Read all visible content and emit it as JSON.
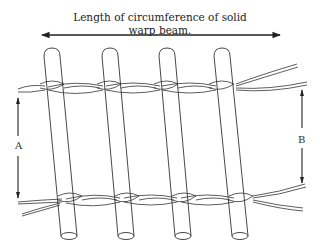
{
  "diagram": {
    "title_line1": "Length of circumference of solid",
    "title_line2": "warp beam.",
    "label_a": "A",
    "label_b": "B",
    "line_color": "#222222",
    "rods": [
      {
        "top_x": 52,
        "top_y": 50,
        "bottom_x": 69,
        "bottom_y": 236
      },
      {
        "top_x": 110,
        "top_y": 50,
        "bottom_x": 126,
        "bottom_y": 236
      },
      {
        "top_x": 167,
        "top_y": 50,
        "bottom_x": 183,
        "bottom_y": 236
      },
      {
        "top_x": 222,
        "top_y": 50,
        "bottom_x": 240,
        "bottom_y": 236
      }
    ]
  }
}
